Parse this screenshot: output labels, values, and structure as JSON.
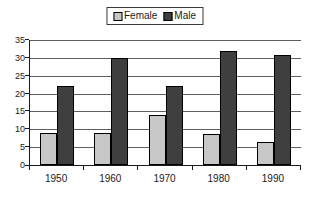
{
  "chart_data": {
    "type": "bar",
    "title": "",
    "xlabel": "",
    "ylabel": "",
    "categories": [
      "1950",
      "1960",
      "1970",
      "1980",
      "1990"
    ],
    "series": [
      {
        "name": "Female",
        "color": "#c7c7c7",
        "values": [
          9,
          9,
          14,
          8.7,
          6.5
        ]
      },
      {
        "name": "Male",
        "color": "#3f3f3f",
        "values": [
          22,
          30,
          22,
          31.8,
          30.7
        ]
      }
    ],
    "ylim": [
      0,
      35
    ],
    "ytick_step": 5,
    "ytick_labels": [
      "0",
      "5",
      "10",
      "15",
      "20",
      "25",
      "30",
      "35"
    ],
    "grid": true,
    "gridline_color": "#5e5e5e",
    "axis_color": "#1a1a1a",
    "legend_position": "top-center",
    "legend_border_color": "#3a3a3a",
    "bar_border_color": "#000000",
    "background_color": "#ffffff"
  }
}
